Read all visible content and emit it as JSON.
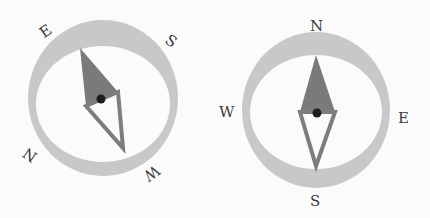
{
  "colors": {
    "background": "#fbfbfb",
    "ring": "#c8c8c8",
    "needle_north": "#7a7a7a",
    "needle_south_outline": "#7d7d7d",
    "pivot": "#1e1e1e",
    "label": "#3a3a3a"
  },
  "compasses": [
    {
      "name": "rotated-compass",
      "labels": {
        "n": "N",
        "e": "E",
        "s": "S",
        "w": "W"
      }
    },
    {
      "name": "upright-compass",
      "labels": {
        "n": "N",
        "e": "E",
        "s": "S",
        "w": "W"
      }
    }
  ]
}
